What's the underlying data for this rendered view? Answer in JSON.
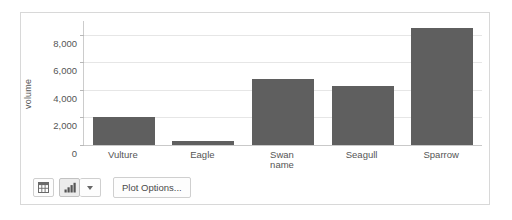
{
  "chart_data": {
    "type": "bar",
    "title": "",
    "categories": [
      "Vulture",
      "Eagle",
      "Swan",
      "Seagull",
      "Sparrow"
    ],
    "values": [
      2000,
      300,
      4800,
      4300,
      8500
    ],
    "xlabel": "name",
    "ylabel": "volume",
    "ylim": [
      0,
      9000
    ],
    "yticks": [
      0,
      2000,
      4000,
      6000,
      8000
    ],
    "ytick_labels": [
      "0",
      "2,000",
      "4,000",
      "6,000",
      "8,000"
    ],
    "grid": true,
    "legend": false,
    "bar_color": "#5f5f5f"
  },
  "toolbar": {
    "table_view_label": "table-view",
    "chart_view_label": "chart-view",
    "chart_type_dropdown_label": "chart-type",
    "plot_options_label": "Plot Options..."
  },
  "colors": {
    "bar": "#5f5f5f",
    "gridline": "#e6e6e6",
    "axis": "#c9c9c9",
    "text": "#555555",
    "card_border": "#d8d8d8"
  }
}
